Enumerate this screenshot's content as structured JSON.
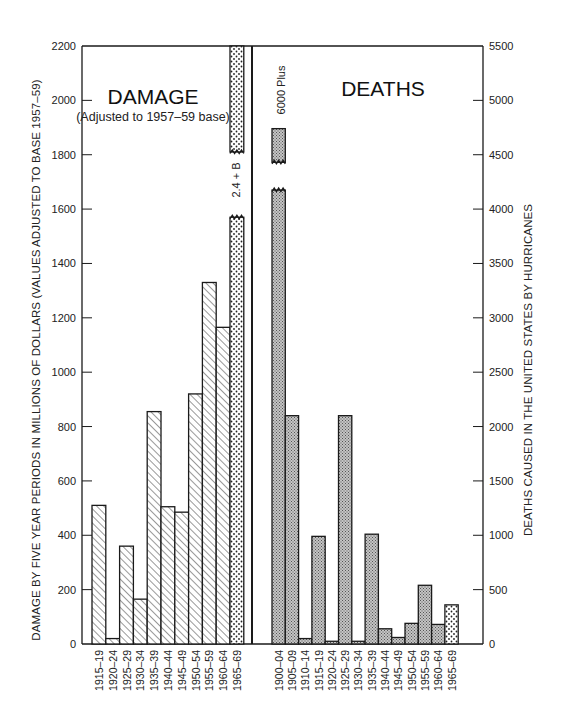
{
  "chart_data": [
    {
      "type": "bar",
      "title": "DAMAGE",
      "subtitle": "(Adjusted to 1957-59 base)",
      "ylabel": "DAMAGE BY FIVE YEAR PERIODS IN MILLIONS OF DOLLARS (VALUES ADJUSTED TO BASE 1957-59)",
      "xlabel": "",
      "ylim": [
        0,
        2200
      ],
      "yticks": [
        0,
        200,
        400,
        600,
        800,
        1000,
        1200,
        1400,
        1600,
        1800,
        2000,
        2200
      ],
      "y_axis_position": "left",
      "categories": [
        "1915-19",
        "1920-24",
        "1925-29",
        "1930-34",
        "1935-39",
        "1940-44",
        "1945-49",
        "1950-54",
        "1955-59",
        "1960-64",
        "1965-69"
      ],
      "values": [
        510,
        20,
        360,
        165,
        855,
        505,
        485,
        920,
        1330,
        1165,
        2400
      ],
      "annotations": [
        {
          "category": "1965-69",
          "text": "2.4 + B",
          "note": "bar broken, exceeds axis (billions)"
        }
      ],
      "grid": false
    },
    {
      "type": "bar",
      "title": "DEATHS",
      "ylabel": "DEATHS CAUSED IN THE UNITED STATES BY HURRICANES",
      "xlabel": "",
      "ylim": [
        0,
        5500
      ],
      "yticks": [
        0,
        500,
        1000,
        1500,
        2000,
        2500,
        3000,
        3500,
        4000,
        4500,
        5000,
        5500
      ],
      "y_axis_position": "right",
      "categories": [
        "1900-04",
        "1905-09",
        "1910-14",
        "1915-19",
        "1920-24",
        "1925-29",
        "1930-34",
        "1935-39",
        "1940-44",
        "1945-49",
        "1950-54",
        "1955-59",
        "1960-64",
        "1965-69"
      ],
      "values": [
        6000,
        2100,
        50,
        990,
        25,
        2100,
        25,
        1010,
        140,
        60,
        190,
        540,
        180,
        360
      ],
      "annotations": [
        {
          "category": "1900-04",
          "text": "6000 Plus",
          "note": "bar broken"
        }
      ],
      "grid": false
    }
  ],
  "labels": {
    "damage_title": "DAMAGE",
    "damage_sub": "(Adjusted to 1957–59 base)",
    "deaths_title": "DEATHS",
    "left_axis_title": "DAMAGE BY FIVE YEAR PERIODS IN MILLIONS OF DOLLARS (VALUES ADJUSTED TO BASE 1957–59)",
    "right_axis_title": "DEATHS CAUSED IN THE UNITED STATES BY HURRICANES",
    "damage_break_note": "2.4 + B",
    "deaths_break_note": "6000 Plus"
  },
  "colors": {
    "ink": "#1a1a1a",
    "hatch_fill": "#ffffff",
    "deaths_fill": "#b8b8b8",
    "background": "#ffffff"
  }
}
